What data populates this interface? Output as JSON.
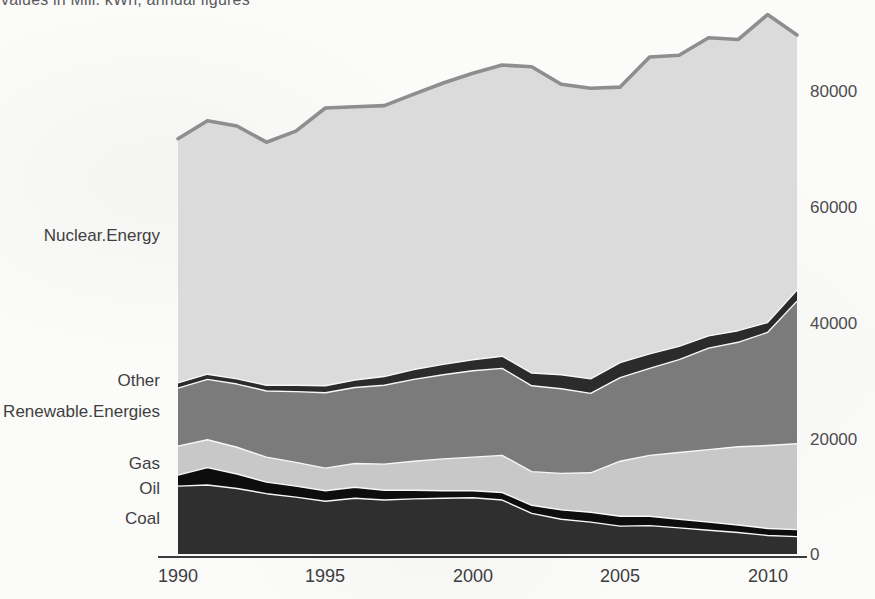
{
  "title": "values in Mill. kWh, annual figures",
  "chart_data": {
    "type": "area",
    "stacked": true,
    "title": "values in Mill. kWh, annual figures",
    "xlabel": "",
    "ylabel": "",
    "unit": "Mill. kWh",
    "x": [
      1990,
      1991,
      1992,
      1993,
      1994,
      1995,
      1996,
      1997,
      1998,
      1999,
      2000,
      2001,
      2002,
      2003,
      2004,
      2005,
      2006,
      2007,
      2008,
      2009,
      2010,
      2011
    ],
    "series": [
      {
        "name": "Coal",
        "color": "#2f2f2f",
        "values": [
          11700,
          11900,
          11300,
          10400,
          9800,
          9100,
          9600,
          9300,
          9500,
          9600,
          9700,
          9300,
          7000,
          6000,
          5500,
          4800,
          4900,
          4500,
          4100,
          3700,
          3200,
          3000
        ]
      },
      {
        "name": "Oil",
        "color": "#0d0d0d",
        "values": [
          1900,
          3000,
          2500,
          2000,
          1900,
          1800,
          1900,
          1700,
          1500,
          1300,
          1200,
          1300,
          1400,
          1600,
          1700,
          1700,
          1600,
          1500,
          1400,
          1300,
          1200,
          1200
        ]
      },
      {
        "name": "Gas",
        "color": "#c8c8c8",
        "values": [
          5000,
          4800,
          4600,
          4300,
          4100,
          3900,
          4100,
          4500,
          5000,
          5500,
          5800,
          6400,
          5800,
          6300,
          6800,
          9500,
          10500,
          11500,
          12500,
          13500,
          14300,
          14800
        ]
      },
      {
        "name": "Renewable.Energies",
        "color": "#7b7b7b",
        "values": [
          10000,
          10400,
          10900,
          11400,
          12200,
          13000,
          13100,
          13600,
          14100,
          14500,
          14900,
          15000,
          14800,
          14600,
          13700,
          14400,
          15000,
          16000,
          17500,
          18000,
          19500,
          24600
        ]
      },
      {
        "name": "Other",
        "color": "#2b2b2b",
        "values": [
          900,
          900,
          900,
          1000,
          1100,
          1200,
          1300,
          1500,
          1700,
          1800,
          1900,
          2100,
          2200,
          2400,
          2500,
          2600,
          2500,
          2300,
          2100,
          2000,
          1700,
          1900
        ]
      },
      {
        "name": "Nuclear.Energy",
        "color": "#dbdbdb",
        "values": [
          42100,
          43700,
          43600,
          41900,
          43800,
          47900,
          47100,
          46700,
          47500,
          48500,
          49400,
          50200,
          52800,
          50100,
          50100,
          47500,
          51200,
          50200,
          51400,
          50200,
          53100,
          44000
        ]
      }
    ],
    "totals": [
      71600,
      74700,
      73800,
      71000,
      72900,
      76900,
      77100,
      77300,
      79300,
      81200,
      82900,
      84300,
      84000,
      81000,
      80300,
      80500,
      85700,
      86000,
      89000,
      88700,
      93000,
      89500
    ],
    "total_line_color": "#8e8e8e",
    "separator_color": "#f7f7f6",
    "axis_color": "#3c3c3c",
    "xticks": [
      "1990",
      "1995",
      "2000",
      "2005",
      "2010"
    ],
    "xtick_years": [
      1990,
      1995,
      2000,
      2005,
      2010
    ],
    "yticks": [
      "80000",
      "60000",
      "40000",
      "20000",
      "0"
    ],
    "ytick_values": [
      80000,
      60000,
      40000,
      20000,
      0
    ],
    "xlim": [
      1990,
      2011
    ],
    "ylim": [
      0,
      80000
    ],
    "grid": false,
    "legend_position": "labels-left-of-plot"
  }
}
